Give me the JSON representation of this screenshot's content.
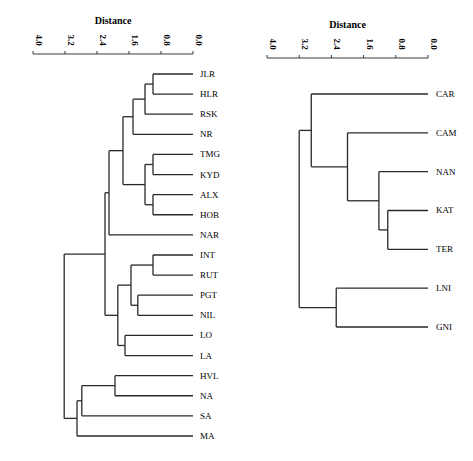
{
  "chart_data": [
    {
      "type": "dendrogram",
      "title": "",
      "xlabel": "Distance",
      "ylabel": "",
      "xlim": [
        4.0,
        0.0
      ],
      "ticks": [
        "4.0",
        "3.2",
        "2.4",
        "1.6",
        "0.8",
        "0.0"
      ],
      "grid": false,
      "leaves": [
        "JLR",
        "HLR",
        "RSK",
        "NR",
        "TMG",
        "KYD",
        "ALX",
        "HOB",
        "NAR",
        "INT",
        "RUT",
        "PGT",
        "NIL",
        "LO",
        "LA",
        "HVL",
        "NA",
        "SA",
        "MA"
      ],
      "merges": [
        {
          "id": "a",
          "children": [
            "JLR",
            "HLR"
          ],
          "distance": 1.0
        },
        {
          "id": "b",
          "children": [
            "a",
            "RSK"
          ],
          "distance": 1.2
        },
        {
          "id": "c",
          "children": [
            "b",
            "NR"
          ],
          "distance": 1.5
        },
        {
          "id": "d",
          "children": [
            "TMG",
            "KYD"
          ],
          "distance": 1.0
        },
        {
          "id": "e",
          "children": [
            "ALX",
            "HOB"
          ],
          "distance": 1.0
        },
        {
          "id": "f",
          "children": [
            "d",
            "e"
          ],
          "distance": 1.2
        },
        {
          "id": "g",
          "children": [
            "c",
            "f"
          ],
          "distance": 1.75
        },
        {
          "id": "h",
          "children": [
            "g",
            "NAR"
          ],
          "distance": 2.1
        },
        {
          "id": "i",
          "children": [
            "INT",
            "RUT"
          ],
          "distance": 1.0
        },
        {
          "id": "j",
          "children": [
            "PGT",
            "NIL"
          ],
          "distance": 1.38
        },
        {
          "id": "k",
          "children": [
            "i",
            "j"
          ],
          "distance": 1.55
        },
        {
          "id": "l",
          "children": [
            "LO",
            "LA"
          ],
          "distance": 1.7
        },
        {
          "id": "m",
          "children": [
            "k",
            "l"
          ],
          "distance": 1.88
        },
        {
          "id": "n",
          "children": [
            "h",
            "m"
          ],
          "distance": 2.2
        },
        {
          "id": "o",
          "children": [
            "HVL",
            "NA"
          ],
          "distance": 1.95
        },
        {
          "id": "p",
          "children": [
            "o",
            "SA"
          ],
          "distance": 2.78
        },
        {
          "id": "q",
          "children": [
            "p",
            "MA"
          ],
          "distance": 2.9
        },
        {
          "id": "root",
          "children": [
            "n",
            "q"
          ],
          "distance": 3.22
        }
      ]
    },
    {
      "type": "dendrogram",
      "title": "",
      "xlabel": "Distance",
      "ylabel": "",
      "xlim": [
        4.0,
        0.0
      ],
      "ticks": [
        "4.0",
        "3.2",
        "2.4",
        "1.6",
        "0.8",
        "0.0"
      ],
      "grid": false,
      "leaves": [
        "CAR",
        "CAM",
        "NAN",
        "KAT",
        "TER",
        "LNI",
        "GNI"
      ],
      "merges": [
        {
          "id": "a",
          "children": [
            "KAT",
            "TER"
          ],
          "distance": 1.0
        },
        {
          "id": "b",
          "children": [
            "NAN",
            "a"
          ],
          "distance": 1.22
        },
        {
          "id": "c",
          "children": [
            "CAM",
            "b"
          ],
          "distance": 2.0
        },
        {
          "id": "d",
          "children": [
            "CAR",
            "c"
          ],
          "distance": 2.9
        },
        {
          "id": "e",
          "children": [
            "LNI",
            "GNI"
          ],
          "distance": 2.28
        },
        {
          "id": "root",
          "children": [
            "d",
            "e"
          ],
          "distance": 3.2
        }
      ]
    }
  ],
  "layout": {
    "left": {
      "x0": 33,
      "x1": 193,
      "axis_y": 54,
      "leaf_y_start": 74,
      "leaf_spacing": 20.11,
      "label_x": 200
    },
    "right": {
      "x0": 267,
      "x1": 428,
      "axis_y": 58,
      "leaf_y_start": 94,
      "leaf_spacing": 38.83,
      "label_x": 436
    }
  },
  "colors": {
    "line": "#2a2a2a",
    "text": "#1a1a1a",
    "background": "#ffffff"
  }
}
